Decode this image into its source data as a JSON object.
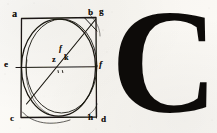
{
  "page": {
    "kind": "scanned-book-page-fragment",
    "width": 217,
    "height": 133,
    "paper_color": "#fbfaf7",
    "ink_color": "#15130f"
  },
  "figure": {
    "caption": "geometric construction: square with inscribed circle, diameter and diagonal",
    "labels": [
      {
        "id": "a",
        "text": "a",
        "role": "square-corner-top-left"
      },
      {
        "id": "b",
        "text": "b",
        "role": "square-corner-top-right"
      },
      {
        "id": "g",
        "text": "g",
        "role": "arc-point-top-right"
      },
      {
        "id": "e",
        "text": "e",
        "role": "diameter-endpoint-left"
      },
      {
        "id": "f_center",
        "text": "f",
        "role": "center-upper-point"
      },
      {
        "id": "z",
        "text": "z",
        "role": "center-point"
      },
      {
        "id": "k",
        "text": "k",
        "role": "center-right-point"
      },
      {
        "id": "f_right",
        "text": "f",
        "role": "arc-point-right"
      },
      {
        "id": "c",
        "text": "c",
        "role": "square-corner-bottom-left"
      },
      {
        "id": "h",
        "text": "h",
        "role": "arc-point-bottom-right"
      },
      {
        "id": "d",
        "text": "d",
        "role": "square-corner-bottom-right"
      }
    ],
    "elements": [
      "outer-square",
      "inscribed-circle",
      "secondary-offset-circle",
      "horizontal-diameter",
      "diagonal-line",
      "corner-chord-top-right"
    ]
  },
  "letter": {
    "glyph": "C",
    "style": "serif-capital-drop-cap",
    "color": "#0d0b09"
  }
}
